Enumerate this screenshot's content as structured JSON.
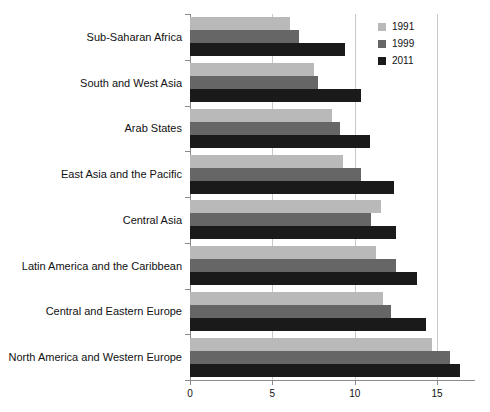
{
  "chart_data": {
    "type": "bar",
    "orientation": "horizontal",
    "title": "",
    "subtitle": "",
    "xlabel": "",
    "ylabel": "",
    "xlim": [
      0,
      17.3
    ],
    "ylim": null,
    "grid": true,
    "grid_axis": "x",
    "legend_position": "top-right",
    "xticks": [
      0,
      5,
      10,
      15
    ],
    "xtick_labels": [
      "0",
      "5",
      "10",
      "15"
    ],
    "categories": [
      "Sub-Saharan Africa",
      "South and West Asia",
      "Arab States",
      "East Asia and the Pacific",
      "Central Asia",
      "Latin America and the Caribbean",
      "Central and Eastern Europe",
      "North America and Western Europe"
    ],
    "series": [
      {
        "name": "1991",
        "color": "#b9b9b9",
        "values": [
          6.1,
          7.5,
          8.6,
          9.3,
          11.6,
          11.3,
          11.7,
          14.7
        ]
      },
      {
        "name": "1999",
        "color": "#666666",
        "values": [
          6.6,
          7.8,
          9.1,
          10.4,
          11.0,
          12.5,
          12.2,
          15.8
        ]
      },
      {
        "name": "2011",
        "color": "#1a1a1a",
        "values": [
          9.4,
          10.4,
          10.9,
          12.4,
          12.5,
          13.8,
          14.3,
          16.4
        ]
      }
    ]
  },
  "legend": {
    "items": [
      {
        "label": "1991",
        "color": "#b9b9b9"
      },
      {
        "label": "1999",
        "color": "#666666"
      },
      {
        "label": "2011",
        "color": "#1a1a1a"
      }
    ]
  }
}
